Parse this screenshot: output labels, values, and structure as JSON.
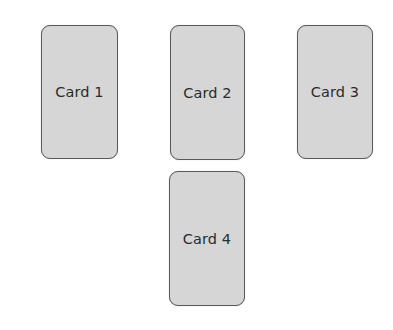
{
  "cards": [
    {
      "label": "Card 1"
    },
    {
      "label": "Card 2"
    },
    {
      "label": "Card 3"
    },
    {
      "label": "Card 4"
    }
  ]
}
